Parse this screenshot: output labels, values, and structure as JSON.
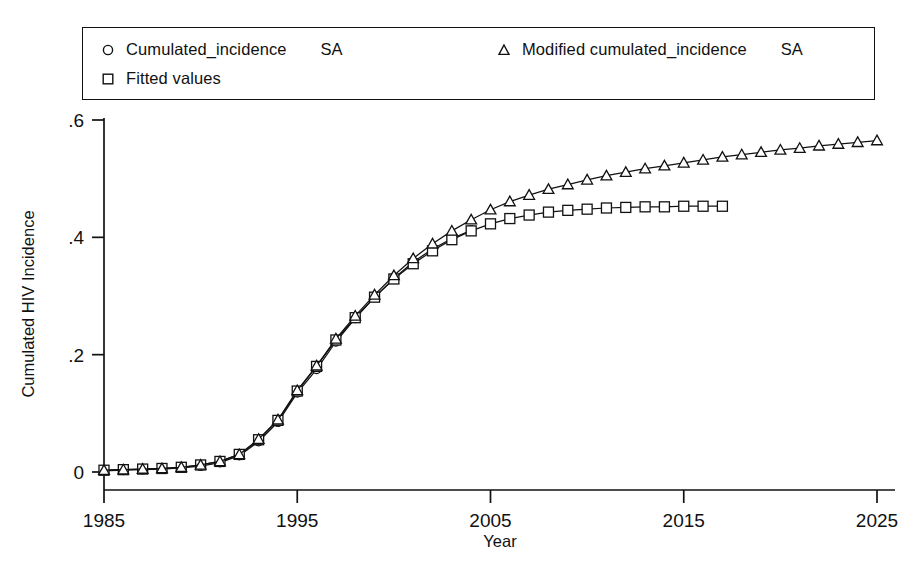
{
  "legend": {
    "entries": [
      {
        "marker": "circle-marker",
        "label": "Cumulated_incidence",
        "suffix": "SA"
      },
      {
        "marker": "square-marker",
        "label": "Fitted values",
        "suffix": ""
      },
      {
        "marker": "triangle-marker",
        "label": "Modified  cumulated_incidence",
        "suffix": "SA"
      }
    ]
  },
  "chart_data": {
    "type": "line",
    "title": "",
    "xlabel": "Year",
    "ylabel": "Cumulated HIV Incidence",
    "xlim": [
      1985,
      2025
    ],
    "ylim": [
      0,
      0.6
    ],
    "xticks": [
      1985,
      1995,
      2005,
      2015,
      2025
    ],
    "xticklabels": [
      "1985",
      "1995",
      "2005",
      "2015",
      "2025"
    ],
    "yticks": [
      0,
      0.2,
      0.4,
      0.6
    ],
    "yticklabels": [
      "0",
      ".2",
      ".4",
      ".6"
    ],
    "grid": false,
    "legend_position": "top",
    "series": [
      {
        "name": "Cumulated_incidence   SA",
        "marker": "circle",
        "x": [
          1985,
          1986,
          1987,
          1988,
          1989,
          1990,
          1991,
          1992,
          1993,
          1994,
          1995,
          1996,
          1997,
          1998,
          1999,
          2000,
          2001,
          2002,
          2003,
          2004
        ],
        "values": [
          0.002,
          0.003,
          0.004,
          0.005,
          0.007,
          0.01,
          0.016,
          0.028,
          0.052,
          0.085,
          0.135,
          0.175,
          0.222,
          0.262,
          0.298,
          0.33,
          0.358,
          0.38,
          0.398,
          0.412
        ]
      },
      {
        "name": "Fitted values",
        "marker": "square",
        "x": [
          1985,
          1986,
          1987,
          1988,
          1989,
          1990,
          1991,
          1992,
          1993,
          1994,
          1995,
          1996,
          1997,
          1998,
          1999,
          2000,
          2001,
          2002,
          2003,
          2004,
          2005,
          2006,
          2007,
          2008,
          2009,
          2010,
          2011,
          2012,
          2013,
          2014,
          2015,
          2016,
          2017
        ],
        "values": [
          0.003,
          0.004,
          0.005,
          0.006,
          0.008,
          0.012,
          0.018,
          0.03,
          0.055,
          0.088,
          0.138,
          0.18,
          0.225,
          0.263,
          0.298,
          0.329,
          0.355,
          0.377,
          0.396,
          0.411,
          0.423,
          0.432,
          0.438,
          0.443,
          0.446,
          0.448,
          0.45,
          0.451,
          0.452,
          0.452,
          0.453,
          0.453,
          0.453
        ]
      },
      {
        "name": "Modified  cumulated_incidence   SA",
        "marker": "triangle",
        "x": [
          1985,
          1986,
          1987,
          1988,
          1989,
          1990,
          1991,
          1992,
          1993,
          1994,
          1995,
          1996,
          1997,
          1998,
          1999,
          2000,
          2001,
          2002,
          2003,
          2004,
          2005,
          2006,
          2007,
          2008,
          2009,
          2010,
          2011,
          2012,
          2013,
          2014,
          2015,
          2016,
          2017,
          2018,
          2019,
          2020,
          2021,
          2022,
          2023,
          2024,
          2025
        ],
        "values": [
          0.003,
          0.004,
          0.005,
          0.006,
          0.008,
          0.012,
          0.018,
          0.03,
          0.056,
          0.089,
          0.139,
          0.181,
          0.227,
          0.266,
          0.302,
          0.335,
          0.364,
          0.389,
          0.411,
          0.43,
          0.447,
          0.461,
          0.472,
          0.482,
          0.49,
          0.498,
          0.505,
          0.511,
          0.517,
          0.522,
          0.527,
          0.532,
          0.537,
          0.541,
          0.545,
          0.549,
          0.552,
          0.556,
          0.559,
          0.562,
          0.565
        ]
      }
    ]
  }
}
